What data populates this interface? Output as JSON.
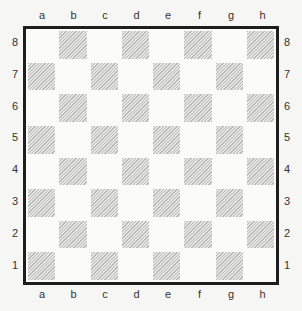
{
  "board": {
    "files_top": [
      "a",
      "b",
      "c",
      "d",
      "e",
      "f",
      "g",
      "h"
    ],
    "files_bottom": [
      "a",
      "b",
      "c",
      "d",
      "e",
      "f",
      "g",
      "h"
    ],
    "ranks_left": [
      "8",
      "7",
      "6",
      "5",
      "4",
      "3",
      "2",
      "1"
    ],
    "ranks_right": [
      "8",
      "7",
      "6",
      "5",
      "4",
      "3",
      "2",
      "1"
    ],
    "colors": {
      "border": "#1e1e1e",
      "light_square": "#fbfbfa",
      "dark_square_hatch": "#b9b9b7",
      "background": "#f6f6f4"
    },
    "pieces": []
  }
}
